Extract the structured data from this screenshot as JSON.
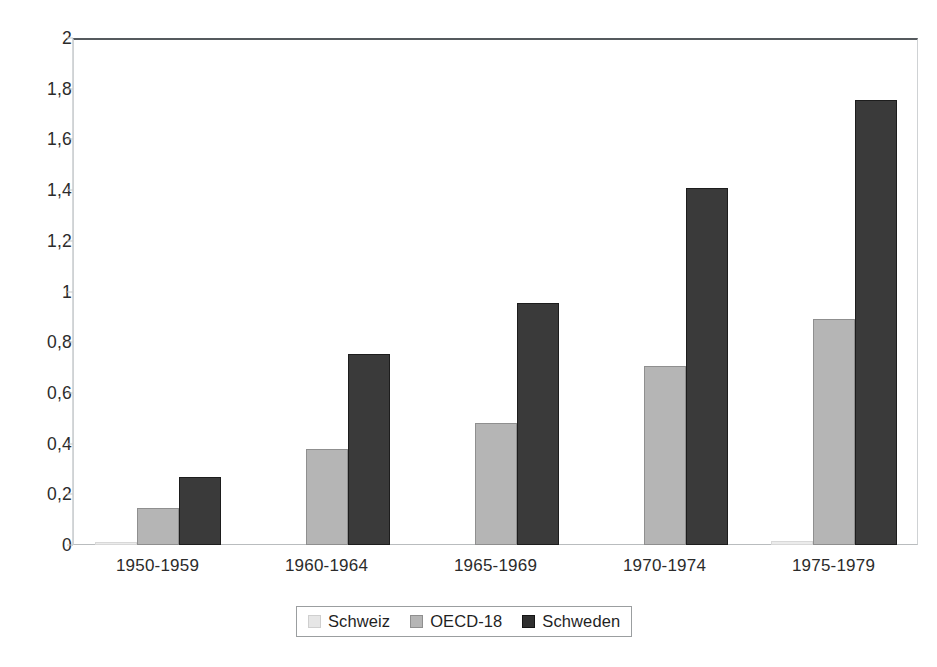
{
  "chart_data": {
    "type": "bar",
    "title": "",
    "subtitle": "",
    "xlabel": "",
    "ylabel": "",
    "categories": [
      "1950-1959",
      "1960-1964",
      "1965-1969",
      "1970-1974",
      "1975-1979"
    ],
    "series": [
      {
        "name": "Schweiz",
        "color": "#ebebeb",
        "values": [
          0.01,
          0.0,
          0.0,
          0.0,
          0.015
        ]
      },
      {
        "name": "OECD-18",
        "color": "#b5b5b5",
        "values": [
          0.145,
          0.38,
          0.48,
          0.705,
          0.89
        ]
      },
      {
        "name": "Schweden",
        "color": "#3a3a3a",
        "values": [
          0.27,
          0.755,
          0.955,
          1.41,
          1.755
        ]
      }
    ],
    "ylim": [
      0,
      2
    ],
    "ytick_values": [
      0,
      0.2,
      0.4,
      0.6,
      0.8,
      1,
      1.2,
      1.4,
      1.6,
      1.8,
      2
    ],
    "ytick_labels": [
      "0",
      "0,2",
      "0,4",
      "0,6",
      "0,8",
      "1",
      "1,2",
      "1,4",
      "1,6",
      "1,8",
      "2"
    ],
    "grid": false,
    "legend_position": "bottom",
    "decimal_separator": ","
  },
  "legend": {
    "items": [
      {
        "label": "Schweiz",
        "swatch": "schweiz-swatch"
      },
      {
        "label": "OECD-18",
        "swatch": "oecd-18-swatch"
      },
      {
        "label": "Schweden",
        "swatch": "schweden-swatch"
      }
    ]
  }
}
